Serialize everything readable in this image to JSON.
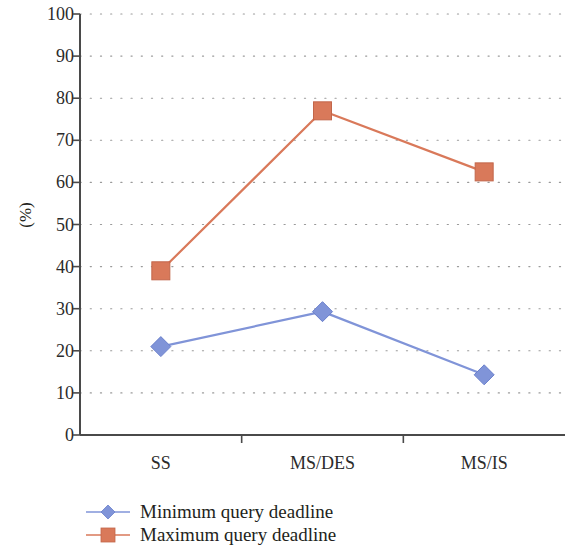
{
  "chart_data": {
    "type": "line",
    "title": "",
    "subtitle": "",
    "xlabel": "",
    "ylabel": "(%)",
    "categories": [
      "SS",
      "MS/DES",
      "MS/IS"
    ],
    "ylim": [
      0,
      100
    ],
    "ytick_values": [
      0,
      10,
      20,
      30,
      40,
      50,
      60,
      70,
      80,
      90,
      100
    ],
    "ytick_labels": [
      "0",
      "10",
      "20",
      "30",
      "40",
      "50",
      "60",
      "70",
      "80",
      "90",
      "100"
    ],
    "grid": "horizontal-dotted",
    "legend_position": "bottom-left",
    "series": [
      {
        "name": "Minimum query deadline",
        "values": [
          21.0,
          29.3,
          14.3
        ],
        "color": "#8094d8",
        "marker": "diamond"
      },
      {
        "name": "Maximum query deadline",
        "values": [
          39.0,
          77.0,
          62.5
        ],
        "color": "#d9795a",
        "marker": "square"
      }
    ]
  },
  "axis": {
    "line_color": "#4a4a4a",
    "grid_color": "#9a9a9a"
  }
}
